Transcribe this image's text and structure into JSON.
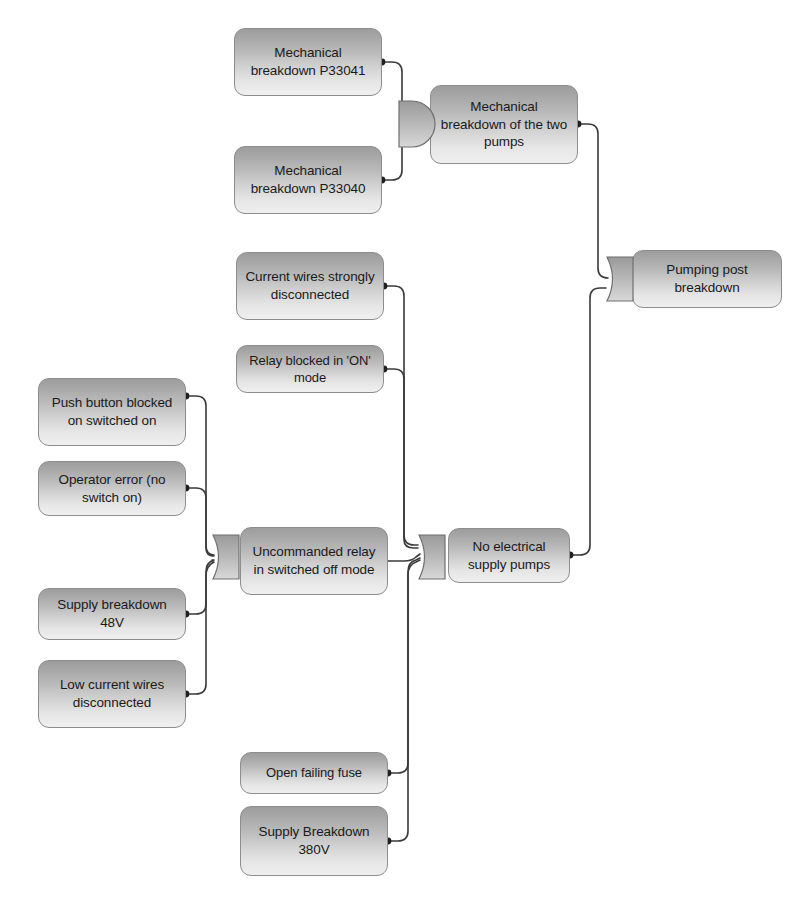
{
  "diagram": {
    "type": "fault-tree",
    "colors": {
      "box_top": "#9d9d9d",
      "box_bottom": "#efefef",
      "box_border": "#8d8d8d",
      "wire": "#3a3a3a",
      "dot": "#202020",
      "background": "#ffffff"
    }
  },
  "nodes": {
    "mech_p33041": {
      "label": "Mechanical breakdown P33041",
      "kind": "basic-event"
    },
    "mech_p33040": {
      "label": "Mechanical breakdown P33040",
      "kind": "basic-event"
    },
    "mech_two_pumps": {
      "label": "Mechanical breakdown of the two pumps",
      "kind": "intermediate-event"
    },
    "pumping_post": {
      "label": "Pumping post breakdown",
      "kind": "top-event"
    },
    "current_wires": {
      "label": "Current wires strongly disconnected",
      "kind": "basic-event"
    },
    "relay_on": {
      "label": "Relay blocked in 'ON' mode",
      "kind": "basic-event"
    },
    "push_button": {
      "label": "Push button blocked on switched on",
      "kind": "basic-event"
    },
    "operator_error": {
      "label": "Operator error (no switch on)",
      "kind": "basic-event"
    },
    "supply_48v": {
      "label": "Supply breakdown 48V",
      "kind": "basic-event"
    },
    "low_current": {
      "label": "Low current wires disconnected",
      "kind": "basic-event"
    },
    "uncommanded": {
      "label": "Uncommanded relay in switched off mode",
      "kind": "intermediate-event"
    },
    "no_supply": {
      "label": "No electrical supply pumps",
      "kind": "intermediate-event"
    },
    "open_fuse": {
      "label": "Open failing fuse",
      "kind": "basic-event"
    },
    "supply_380v": {
      "label": "Supply Breakdown 380V",
      "kind": "basic-event"
    }
  },
  "gates": {
    "gate_pumps": {
      "type": "AND",
      "output": "mech_two_pumps",
      "inputs": [
        "mech_p33041",
        "mech_p33040"
      ]
    },
    "gate_top": {
      "type": "OR",
      "output": "pumping_post",
      "inputs": [
        "mech_two_pumps",
        "no_supply"
      ]
    },
    "gate_relay": {
      "type": "OR",
      "output": "uncommanded",
      "inputs": [
        "push_button",
        "operator_error",
        "supply_48v",
        "low_current"
      ]
    },
    "gate_no_supply": {
      "type": "OR",
      "output": "no_supply",
      "inputs": [
        "current_wires",
        "relay_on",
        "uncommanded",
        "open_fuse",
        "supply_380v"
      ]
    }
  }
}
